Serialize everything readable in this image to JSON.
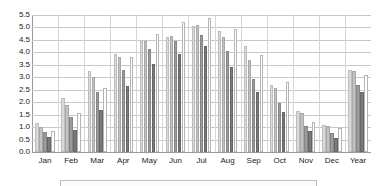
{
  "chart_data": {
    "type": "bar",
    "title": "",
    "subtitle": "",
    "xlabel": "",
    "ylabel": "",
    "ylim": [
      0.0,
      5.5
    ],
    "ytick_step": 0.5,
    "grid": true,
    "legend_position": "bottom",
    "orientation": "vertical",
    "grouped": true,
    "categories": [
      "Jan",
      "Feb",
      "Mar",
      "Apr",
      "May",
      "Jun",
      "Jul",
      "Aug",
      "Sep",
      "Oct",
      "Nov",
      "Dec",
      "Year"
    ],
    "ytick_labels": [
      "5.5",
      "5.0",
      "4.5",
      "4.0",
      "3.5",
      "3.0",
      "2.5",
      "2.0",
      "1.5",
      "1.0",
      "0.5",
      "0.0"
    ],
    "series": [
      {
        "name": "Series 1",
        "color": "#d9d9d9",
        "values": [
          1.15,
          2.15,
          3.25,
          3.95,
          4.45,
          4.6,
          5.05,
          4.85,
          4.25,
          2.7,
          1.65,
          1.1,
          3.3
        ]
      },
      {
        "name": "Series 2",
        "color": "#c2c2c2",
        "values": [
          1.0,
          1.9,
          3.0,
          3.8,
          4.45,
          4.65,
          5.1,
          4.6,
          3.7,
          2.55,
          1.55,
          1.05,
          3.25
        ]
      },
      {
        "name": "Series 3",
        "color": "#9c9c9c",
        "values": [
          0.8,
          1.4,
          2.4,
          3.3,
          4.15,
          4.45,
          4.7,
          4.05,
          2.95,
          1.95,
          1.05,
          0.75,
          2.7
        ]
      },
      {
        "name": "Series 4",
        "color": "#7a7a7a",
        "values": [
          0.6,
          0.9,
          1.7,
          2.65,
          3.55,
          3.95,
          4.25,
          3.4,
          2.4,
          1.6,
          0.85,
          0.55,
          2.4
        ]
      },
      {
        "name": "Series 5",
        "color": "#ffffff",
        "values": [
          0.85,
          1.55,
          2.55,
          3.8,
          4.75,
          5.2,
          5.4,
          4.95,
          3.9,
          2.8,
          1.2,
          0.95,
          3.1
        ]
      }
    ]
  },
  "legend": {
    "visible": true,
    "clipped": true,
    "entries": []
  }
}
